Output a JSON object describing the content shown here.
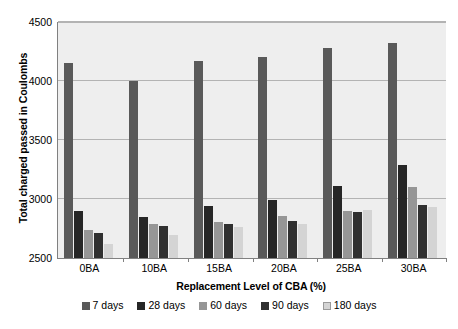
{
  "chart_data": {
    "type": "bar",
    "title": "",
    "xlabel": "Replacement Level of CBA (%)",
    "ylabel": "Total charged passed in Coulombs",
    "categories": [
      "0BA",
      "10BA",
      "15BA",
      "20BA",
      "25BA",
      "30BA"
    ],
    "ylim": [
      2500,
      4500
    ],
    "yticks": [
      2500,
      3000,
      3500,
      4000,
      4500
    ],
    "ytick_labels": [
      "2500",
      "3000",
      "3500",
      "4000",
      "4500"
    ],
    "grid": true,
    "legend_position": "bottom",
    "series": [
      {
        "name": "7 days",
        "color": "#595959",
        "values": [
          4150,
          4000,
          4170,
          4200,
          4280,
          4320
        ]
      },
      {
        "name": "28 days",
        "color": "#262626",
        "values": [
          2900,
          2850,
          2940,
          2995,
          3110,
          3290
        ]
      },
      {
        "name": "60 days",
        "color": "#969696",
        "values": [
          2740,
          2785,
          2805,
          2860,
          2900,
          3100
        ]
      },
      {
        "name": "90 days",
        "color": "#303030",
        "values": [
          2710,
          2770,
          2790,
          2815,
          2890,
          2950
        ]
      },
      {
        "name": "180 days",
        "color": "#d4d4d4",
        "values": [
          2620,
          2695,
          2765,
          2790,
          2905,
          2930
        ]
      }
    ]
  },
  "legend": {
    "items": [
      {
        "label": "7 days",
        "color": "#595959"
      },
      {
        "label": "28 days",
        "color": "#262626"
      },
      {
        "label": "60 days",
        "color": "#969696"
      },
      {
        "label": "90 days",
        "color": "#303030"
      },
      {
        "label": "180 days",
        "color": "#d4d4d4"
      }
    ]
  },
  "axes": {
    "y_title": "Total charged passed in Coulombs",
    "x_title": "Replacement Level of CBA (%)"
  }
}
